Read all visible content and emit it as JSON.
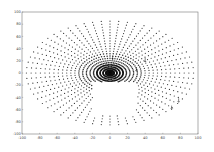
{
  "chart_data": {
    "type": "scatter",
    "title": "",
    "xlabel": "",
    "ylabel": "",
    "xlim": [
      -100,
      100
    ],
    "ylim": [
      -100,
      100
    ],
    "xticks": [
      -100,
      -80,
      -60,
      -40,
      -20,
      0,
      20,
      40,
      60,
      80,
      100
    ],
    "yticks": [
      100,
      80,
      60,
      40,
      20,
      0,
      -20,
      -40,
      -60,
      -80,
      -100
    ],
    "grid": false,
    "legend": null,
    "series": [
      {
        "name": "elliptical point grid",
        "marker": "dot",
        "color": "#333333",
        "center": [
          0,
          0
        ],
        "ring_count": 22,
        "spokes": 60,
        "x_radius_max": 95,
        "y_radius_max": 85,
        "description": "Points arranged on concentric ellipses along radial spokes, denser near the center (0,0); a hollow region below the center around x∈[-20,30], y∈[-70,-15]."
      }
    ],
    "annotations": [
      {
        "type": "arrow",
        "x": 3,
        "y": 22,
        "label": ""
      },
      {
        "type": "arrow",
        "x": 40,
        "y": 18,
        "label": ""
      },
      {
        "type": "arrow",
        "x": 30,
        "y": 3,
        "label": ""
      },
      {
        "type": "arrow",
        "x": 78,
        "y": -48,
        "label": ""
      },
      {
        "type": "arrow",
        "x": 70,
        "y": -60,
        "label": ""
      }
    ]
  },
  "axes": {
    "left": 22,
    "top": 12,
    "right": 198,
    "bottom": 134
  }
}
